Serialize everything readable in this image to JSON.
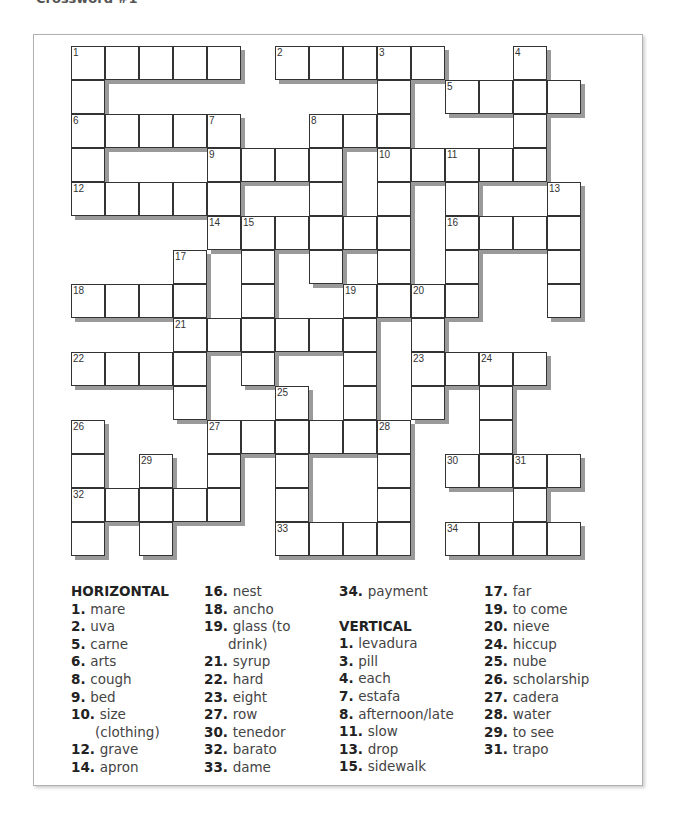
{
  "page": {
    "title": "Crossword #1"
  },
  "grid": {
    "cell_size": 34,
    "cols": 15,
    "rows": 15,
    "cells": [
      [
        0,
        0,
        "1"
      ],
      [
        0,
        1,
        ""
      ],
      [
        0,
        2,
        ""
      ],
      [
        0,
        3,
        ""
      ],
      [
        0,
        4,
        ""
      ],
      [
        0,
        6,
        "2"
      ],
      [
        0,
        7,
        ""
      ],
      [
        0,
        8,
        ""
      ],
      [
        0,
        9,
        "3"
      ],
      [
        0,
        10,
        ""
      ],
      [
        0,
        13,
        "4"
      ],
      [
        1,
        0,
        ""
      ],
      [
        1,
        9,
        ""
      ],
      [
        1,
        11,
        "5"
      ],
      [
        1,
        12,
        ""
      ],
      [
        1,
        13,
        ""
      ],
      [
        1,
        14,
        ""
      ],
      [
        2,
        0,
        "6"
      ],
      [
        2,
        1,
        ""
      ],
      [
        2,
        2,
        ""
      ],
      [
        2,
        3,
        ""
      ],
      [
        2,
        4,
        "7"
      ],
      [
        2,
        7,
        "8"
      ],
      [
        2,
        8,
        ""
      ],
      [
        2,
        9,
        ""
      ],
      [
        2,
        13,
        ""
      ],
      [
        3,
        0,
        ""
      ],
      [
        3,
        4,
        "9"
      ],
      [
        3,
        5,
        ""
      ],
      [
        3,
        6,
        ""
      ],
      [
        3,
        7,
        ""
      ],
      [
        3,
        9,
        "10"
      ],
      [
        3,
        10,
        ""
      ],
      [
        3,
        11,
        "11"
      ],
      [
        3,
        12,
        ""
      ],
      [
        3,
        13,
        ""
      ],
      [
        4,
        0,
        "12"
      ],
      [
        4,
        1,
        ""
      ],
      [
        4,
        2,
        ""
      ],
      [
        4,
        3,
        ""
      ],
      [
        4,
        4,
        ""
      ],
      [
        4,
        7,
        ""
      ],
      [
        4,
        9,
        ""
      ],
      [
        4,
        11,
        ""
      ],
      [
        4,
        14,
        "13"
      ],
      [
        5,
        4,
        "14"
      ],
      [
        5,
        5,
        "15"
      ],
      [
        5,
        6,
        ""
      ],
      [
        5,
        7,
        ""
      ],
      [
        5,
        8,
        ""
      ],
      [
        5,
        9,
        ""
      ],
      [
        5,
        11,
        "16"
      ],
      [
        5,
        12,
        ""
      ],
      [
        5,
        13,
        ""
      ],
      [
        5,
        14,
        ""
      ],
      [
        6,
        3,
        "17"
      ],
      [
        6,
        5,
        ""
      ],
      [
        6,
        7,
        ""
      ],
      [
        6,
        9,
        ""
      ],
      [
        6,
        11,
        ""
      ],
      [
        6,
        14,
        ""
      ],
      [
        7,
        0,
        "18"
      ],
      [
        7,
        1,
        ""
      ],
      [
        7,
        2,
        ""
      ],
      [
        7,
        3,
        ""
      ],
      [
        7,
        5,
        ""
      ],
      [
        7,
        8,
        "19"
      ],
      [
        7,
        9,
        ""
      ],
      [
        7,
        10,
        "20"
      ],
      [
        7,
        11,
        ""
      ],
      [
        7,
        14,
        ""
      ],
      [
        8,
        3,
        "21"
      ],
      [
        8,
        4,
        ""
      ],
      [
        8,
        5,
        ""
      ],
      [
        8,
        6,
        ""
      ],
      [
        8,
        7,
        ""
      ],
      [
        8,
        8,
        ""
      ],
      [
        8,
        10,
        ""
      ],
      [
        9,
        0,
        "22"
      ],
      [
        9,
        1,
        ""
      ],
      [
        9,
        2,
        ""
      ],
      [
        9,
        3,
        ""
      ],
      [
        9,
        5,
        ""
      ],
      [
        9,
        8,
        ""
      ],
      [
        9,
        10,
        "23"
      ],
      [
        9,
        11,
        ""
      ],
      [
        9,
        12,
        "24"
      ],
      [
        9,
        13,
        ""
      ],
      [
        10,
        3,
        ""
      ],
      [
        10,
        6,
        "25"
      ],
      [
        10,
        8,
        ""
      ],
      [
        10,
        10,
        ""
      ],
      [
        10,
        12,
        ""
      ],
      [
        11,
        0,
        "26"
      ],
      [
        11,
        4,
        "27"
      ],
      [
        11,
        5,
        ""
      ],
      [
        11,
        6,
        ""
      ],
      [
        11,
        7,
        ""
      ],
      [
        11,
        8,
        ""
      ],
      [
        11,
        9,
        "28"
      ],
      [
        11,
        12,
        ""
      ],
      [
        12,
        0,
        ""
      ],
      [
        12,
        2,
        "29"
      ],
      [
        12,
        4,
        ""
      ],
      [
        12,
        6,
        ""
      ],
      [
        12,
        9,
        ""
      ],
      [
        12,
        11,
        "30"
      ],
      [
        12,
        12,
        ""
      ],
      [
        12,
        13,
        "31"
      ],
      [
        12,
        14,
        ""
      ],
      [
        13,
        0,
        "32"
      ],
      [
        13,
        1,
        ""
      ],
      [
        13,
        2,
        ""
      ],
      [
        13,
        3,
        ""
      ],
      [
        13,
        4,
        ""
      ],
      [
        13,
        6,
        ""
      ],
      [
        13,
        9,
        ""
      ],
      [
        13,
        13,
        ""
      ],
      [
        14,
        0,
        ""
      ],
      [
        14,
        2,
        ""
      ],
      [
        14,
        6,
        "33"
      ],
      [
        14,
        7,
        ""
      ],
      [
        14,
        8,
        ""
      ],
      [
        14,
        9,
        ""
      ],
      [
        14,
        11,
        "34"
      ],
      [
        14,
        12,
        ""
      ],
      [
        14,
        13,
        ""
      ],
      [
        14,
        14,
        ""
      ]
    ]
  },
  "clues": {
    "horizontal_heading": "HORIZONTAL",
    "vertical_heading": "VERTICAL",
    "col1": [
      {
        "n": "1.",
        "t": "mare"
      },
      {
        "n": "2.",
        "t": "uva"
      },
      {
        "n": "5.",
        "t": "carne"
      },
      {
        "n": "6.",
        "t": "arts"
      },
      {
        "n": "8.",
        "t": "cough"
      },
      {
        "n": "9.",
        "t": "bed"
      },
      {
        "n": "10.",
        "t": "size"
      },
      {
        "n": "",
        "t": "(clothing)"
      },
      {
        "n": "12.",
        "t": "grave"
      },
      {
        "n": "14.",
        "t": "apron"
      }
    ],
    "col2": [
      {
        "n": "16.",
        "t": "nest"
      },
      {
        "n": "18.",
        "t": "ancho"
      },
      {
        "n": "19.",
        "t": "glass (to"
      },
      {
        "n": "",
        "t": "drink)"
      },
      {
        "n": "21.",
        "t": "syrup"
      },
      {
        "n": "22.",
        "t": "hard"
      },
      {
        "n": "23.",
        "t": "eight"
      },
      {
        "n": "27.",
        "t": "row"
      },
      {
        "n": "30.",
        "t": "tenedor"
      },
      {
        "n": "32.",
        "t": "barato"
      },
      {
        "n": "33.",
        "t": "dame"
      }
    ],
    "col3_horizontal": [
      {
        "n": "34.",
        "t": "payment"
      }
    ],
    "col3_vertical": [
      {
        "n": "1.",
        "t": "levadura"
      },
      {
        "n": "3.",
        "t": "pill"
      },
      {
        "n": "4.",
        "t": "each"
      },
      {
        "n": "7.",
        "t": "estafa"
      },
      {
        "n": "8.",
        "t": "afternoon/late"
      },
      {
        "n": "11.",
        "t": "slow"
      },
      {
        "n": "13.",
        "t": "drop"
      },
      {
        "n": "15.",
        "t": "sidewalk"
      }
    ],
    "col4": [
      {
        "n": "17.",
        "t": "far"
      },
      {
        "n": "19.",
        "t": "to come"
      },
      {
        "n": "20.",
        "t": "nieve"
      },
      {
        "n": "24.",
        "t": "hiccup"
      },
      {
        "n": "25.",
        "t": "nube"
      },
      {
        "n": "26.",
        "t": "scholarship"
      },
      {
        "n": "27.",
        "t": "cadera"
      },
      {
        "n": "28.",
        "t": "water"
      },
      {
        "n": "29.",
        "t": "to see"
      },
      {
        "n": "31.",
        "t": "trapo"
      }
    ]
  }
}
